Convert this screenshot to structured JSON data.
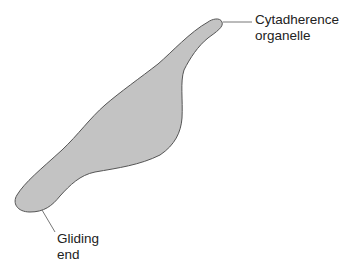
{
  "diagram": {
    "colors": {
      "cell_fill": "#c3c3c3",
      "cell_stroke": "#555555",
      "leader_line": "#777777",
      "text": "#222222",
      "background": "#ffffff"
    },
    "labels": {
      "top": {
        "line1": "Cytadherence",
        "line2": "organelle"
      },
      "bottom": {
        "line1": "Gliding",
        "line2": "end"
      }
    }
  }
}
